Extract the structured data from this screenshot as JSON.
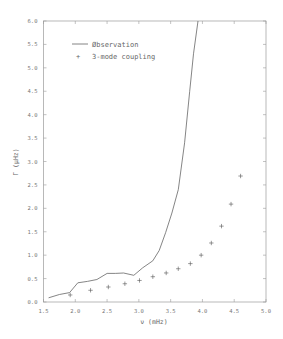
{
  "chart_data": {
    "type": "line",
    "title": "",
    "xlabel": "ν (mHz)",
    "ylabel": "Γ (μHz)",
    "xlim": [
      1.5,
      5.0
    ],
    "ylim": [
      0.0,
      6.0
    ],
    "xticks": [
      "1.5",
      "2.0",
      "2.5",
      "3.0",
      "3.5",
      "4.0",
      "4.5",
      "5.0"
    ],
    "yticks": [
      "0.0",
      "0.5",
      "1.0",
      "1.5",
      "2.0",
      "2.5",
      "3.0",
      "3.5",
      "4.0",
      "4.5",
      "5.0",
      "5.5",
      "6.0"
    ],
    "grid": false,
    "legend_position": "upper left",
    "series": [
      {
        "name": "Øbservation",
        "style": "line",
        "x": [
          1.58,
          1.75,
          1.91,
          2.04,
          2.19,
          2.34,
          2.5,
          2.63,
          2.76,
          2.92,
          3.06,
          3.22,
          3.32,
          3.42,
          3.52,
          3.62,
          3.72,
          3.8,
          3.86,
          3.93
        ],
        "y": [
          0.09,
          0.16,
          0.2,
          0.41,
          0.44,
          0.48,
          0.61,
          0.61,
          0.62,
          0.57,
          0.73,
          0.88,
          1.1,
          1.48,
          1.9,
          2.4,
          3.4,
          4.5,
          5.3,
          6.0
        ]
      },
      {
        "name": "3-mode coupling",
        "style": "markers",
        "marker": "+",
        "x": [
          1.92,
          2.24,
          2.52,
          2.78,
          3.01,
          3.22,
          3.43,
          3.62,
          3.81,
          3.98,
          4.14,
          4.3,
          4.45,
          4.6
        ],
        "y": [
          0.15,
          0.25,
          0.32,
          0.39,
          0.46,
          0.54,
          0.62,
          0.71,
          0.82,
          1.0,
          1.26,
          1.62,
          2.09,
          2.69
        ]
      }
    ]
  },
  "legend": {
    "items": [
      {
        "label": "Øbservation",
        "symbol": "line"
      },
      {
        "label": "3-mode coupling",
        "symbol": "+"
      }
    ]
  },
  "colors": {
    "axis": "#9a9a9a",
    "line": "#666666",
    "marker": "#555555",
    "text": "#777777"
  }
}
